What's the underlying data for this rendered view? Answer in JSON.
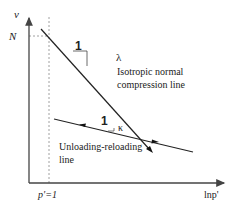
{
  "axes": {
    "y_label": "v",
    "x_label": "lnp'",
    "y_tick_label": "N",
    "x_tick_label": "p'=1"
  },
  "ncl": {
    "slope_symbol": "λ",
    "slope_run_label": "1",
    "label_line1": "Isotropic normal",
    "label_line2": "compression line"
  },
  "url": {
    "slope_symbol": "κ",
    "slope_run_label": "1",
    "label_line1": "Unloading-reloading",
    "label_line2": "line"
  },
  "colors": {
    "line": "#222222",
    "axis": "#444444",
    "dashed": "#888888"
  }
}
